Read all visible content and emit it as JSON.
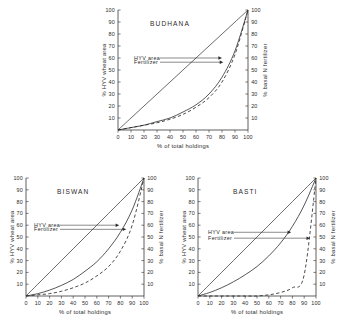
{
  "figure": {
    "background": "#ffffff",
    "ink": "#2b2b2b"
  },
  "axes_common": {
    "xlabel": "% of total holdings",
    "ylabel_left": "% HYV wheat area",
    "ylabel_right": "% basal N fertilizer",
    "xticks": [
      "0",
      "10",
      "20",
      "30",
      "40",
      "50",
      "60",
      "70",
      "80",
      "90",
      "100"
    ],
    "yticks": [
      "10",
      "20",
      "30",
      "40",
      "50",
      "60",
      "70",
      "80",
      "90",
      "100"
    ],
    "xlim": [
      0,
      100
    ],
    "ylim": [
      0,
      100
    ],
    "grid": false
  },
  "annotations": {
    "hyv_label": "HYV area",
    "fertilizer_label": "Fertilizer"
  },
  "chart_data": [
    {
      "type": "line",
      "title": "BUDHANA",
      "xlabel": "% of total holdings",
      "ylabel": "% HYV wheat area",
      "ylabel_right": "% basal N fertilizer",
      "xlim": [
        0,
        100
      ],
      "ylim": [
        0,
        100
      ],
      "grid": false,
      "legend": "inline-arrow-annotations",
      "x": [
        0,
        10,
        20,
        30,
        40,
        50,
        60,
        70,
        80,
        90,
        100
      ],
      "series": [
        {
          "name": "line of equality",
          "style": "solid-thin",
          "values": [
            0,
            10,
            20,
            30,
            40,
            50,
            60,
            70,
            80,
            90,
            100
          ]
        },
        {
          "name": "HYV area",
          "style": "solid",
          "values": [
            0,
            2,
            4,
            7,
            10,
            15,
            21,
            30,
            44,
            66,
            100
          ]
        },
        {
          "name": "Fertilizer",
          "style": "dashed",
          "values": [
            0,
            2,
            4,
            6,
            9,
            13,
            19,
            27,
            40,
            63,
            100
          ]
        }
      ]
    },
    {
      "type": "line",
      "title": "BISWAN",
      "xlabel": "% of total holdings",
      "ylabel": "% HYV wheat area",
      "ylabel_right": "% basal N fertilizer",
      "xlim": [
        0,
        100
      ],
      "ylim": [
        0,
        100
      ],
      "grid": false,
      "legend": "inline-arrow-annotations",
      "x": [
        0,
        10,
        20,
        30,
        40,
        50,
        60,
        70,
        80,
        90,
        100
      ],
      "series": [
        {
          "name": "line of equality",
          "style": "solid-thin",
          "values": [
            0,
            10,
            20,
            30,
            40,
            50,
            60,
            70,
            80,
            90,
            100
          ]
        },
        {
          "name": "HYV area",
          "style": "solid",
          "values": [
            0,
            2,
            5,
            9,
            14,
            21,
            29,
            40,
            54,
            73,
            100
          ]
        },
        {
          "name": "Fertilizer",
          "style": "dashed",
          "values": [
            0,
            1,
            2,
            4,
            7,
            11,
            17,
            25,
            38,
            60,
            100
          ]
        }
      ]
    },
    {
      "type": "line",
      "title": "BASTI",
      "xlabel": "% of total holdings",
      "ylabel": "% HYV wheat area",
      "ylabel_right": "% basal N fertilizer",
      "xlim": [
        0,
        100
      ],
      "ylim": [
        0,
        100
      ],
      "grid": false,
      "legend": "inline-arrow-annotations",
      "x": [
        0,
        10,
        20,
        30,
        40,
        50,
        60,
        70,
        80,
        90,
        100
      ],
      "series": [
        {
          "name": "line of equality",
          "style": "solid-thin",
          "values": [
            0,
            10,
            20,
            30,
            40,
            50,
            60,
            70,
            80,
            90,
            100
          ]
        },
        {
          "name": "HYV area",
          "style": "solid",
          "values": [
            0,
            3,
            7,
            12,
            18,
            25,
            34,
            45,
            59,
            77,
            100
          ]
        },
        {
          "name": "Fertilizer",
          "style": "dashed",
          "values": [
            0,
            0,
            0,
            0,
            0,
            0,
            1,
            3,
            7,
            18,
            100
          ]
        }
      ]
    }
  ]
}
